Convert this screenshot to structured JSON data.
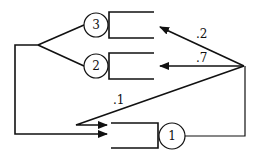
{
  "diagram": {
    "type": "queueing-network",
    "nodes": [
      {
        "id": "1",
        "label": "1"
      },
      {
        "id": "2",
        "label": "2"
      },
      {
        "id": "3",
        "label": "3"
      }
    ],
    "routing": [
      {
        "from": "1",
        "to": "3",
        "probability": ".2"
      },
      {
        "from": "1",
        "to": "2",
        "probability": ".7"
      },
      {
        "from": "1",
        "to": "1",
        "probability": ".1"
      }
    ],
    "colors": {
      "stroke": "#111111",
      "background": "#ffffff"
    }
  }
}
